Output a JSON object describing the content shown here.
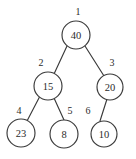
{
  "figure": {
    "background_color": "#ffffff",
    "stroke_color": "#3a3a3a",
    "text_color": "#2b2b2b"
  },
  "chart_data": {
    "type": "diagram",
    "subtype": "binary-tree",
    "title": "",
    "nodes": [
      {
        "index": "1",
        "value": "40",
        "cx": 76,
        "cy": 35,
        "r": 14,
        "index_x": 78,
        "index_y": 11
      },
      {
        "index": "2",
        "value": "15",
        "cx": 48,
        "cy": 86,
        "r": 14,
        "index_x": 41,
        "index_y": 62
      },
      {
        "index": "3",
        "value": "20",
        "cx": 110,
        "cy": 87,
        "r": 13,
        "index_x": 112,
        "index_y": 62
      },
      {
        "index": "4",
        "value": "23",
        "cx": 21,
        "cy": 133,
        "r": 14,
        "index_x": 19,
        "index_y": 110
      },
      {
        "index": "5",
        "value": "8",
        "cx": 64,
        "cy": 134,
        "r": 14,
        "index_x": 70,
        "index_y": 110
      },
      {
        "index": "6",
        "value": "10",
        "cx": 104,
        "cy": 134,
        "r": 13,
        "index_x": 88,
        "index_y": 110
      }
    ],
    "edges": [
      {
        "from": "1",
        "to": "2",
        "x1": 67,
        "y1": 46,
        "x2": 54,
        "y2": 74
      },
      {
        "from": "1",
        "to": "3",
        "x1": 85,
        "y1": 46,
        "x2": 104,
        "y2": 76
      },
      {
        "from": "2",
        "to": "4",
        "x1": 40,
        "y1": 96,
        "x2": 27,
        "y2": 121
      },
      {
        "from": "2",
        "to": "5",
        "x1": 54,
        "y1": 98,
        "x2": 64,
        "y2": 120
      },
      {
        "from": "3",
        "to": "6",
        "x1": 107,
        "y1": 99,
        "x2": 100,
        "y2": 121
      }
    ]
  }
}
